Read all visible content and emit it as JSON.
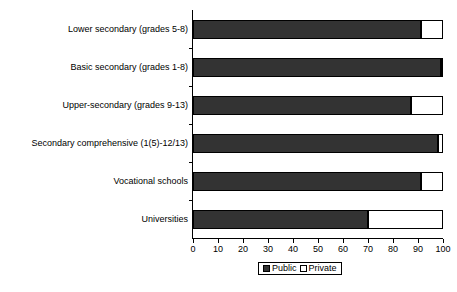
{
  "chart_data": {
    "type": "bar",
    "orientation": "horizontal",
    "stacked": true,
    "title": "",
    "subtitle": "",
    "xlabel": "",
    "ylabel": "",
    "xlim": [
      0,
      100
    ],
    "xticks": [
      0,
      10,
      20,
      30,
      40,
      50,
      60,
      70,
      80,
      90,
      100
    ],
    "grid": false,
    "legend_position": "bottom-center",
    "categories": [
      "Lower secondary (grades 5-8)",
      "Basic secondary (grades 1-8)",
      "Upper-secondary (grades 9-13)",
      "Secondary comprehensive (1(5)-12/13)",
      "Vocational schools",
      "Universities"
    ],
    "series": [
      {
        "name": "Public",
        "color": "#333333",
        "values": [
          91,
          99,
          87,
          98,
          91,
          70
        ]
      },
      {
        "name": "Private",
        "color": "#FFFFFF",
        "values": [
          9,
          1,
          13,
          2,
          9,
          30
        ]
      }
    ]
  },
  "legend": {
    "items": [
      {
        "label": "Public",
        "swatch": "filled-dark-square-icon"
      },
      {
        "label": "Private",
        "swatch": "outlined-white-square-icon"
      }
    ]
  },
  "axis": {
    "x_tick_labels": [
      "0",
      "10",
      "20",
      "30",
      "40",
      "50",
      "60",
      "70",
      "80",
      "90",
      "100"
    ]
  },
  "colors": {
    "public": "#333333",
    "private": "#FFFFFF",
    "axis": "#000000",
    "background": "#FFFFFF"
  }
}
